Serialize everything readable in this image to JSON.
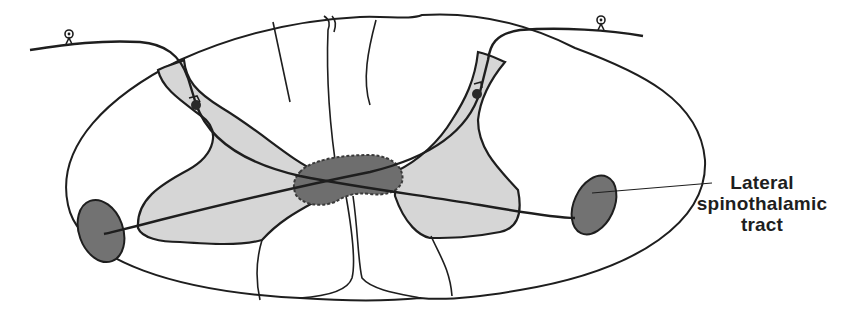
{
  "figure": {
    "label": {
      "lines": [
        "Lateral",
        "spinothalamic",
        "tract"
      ]
    },
    "colors": {
      "outline": "#1e1e1e",
      "white_matter": "#ffffff",
      "gray_matter": "#d6d6d6",
      "central_commissure": "#6e6e6e",
      "tract": "#727272",
      "background": "#ffffff"
    }
  }
}
